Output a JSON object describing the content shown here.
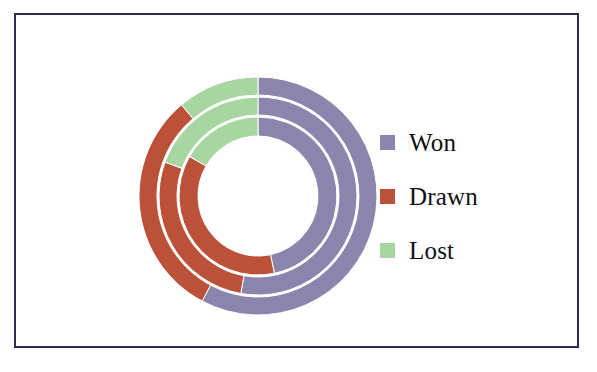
{
  "figure": {
    "background_color": "#ffffff",
    "frame_color": "#2b2b59",
    "title": ""
  },
  "legend": {
    "position": "right",
    "items": [
      {
        "label": "Won",
        "color": "#8b85ad",
        "swatch_name": "legend-swatch-won"
      },
      {
        "label": "Drawn",
        "color": "#bb5138",
        "swatch_name": "legend-swatch-drawn"
      },
      {
        "label": "Lost",
        "color": "#a7d6a1",
        "swatch_name": "legend-swatch-lost"
      }
    ]
  },
  "chart_data": {
    "type": "pie",
    "subtype": "nested-donut",
    "title": "",
    "xlabel": "",
    "ylabel": "",
    "grid": false,
    "legend_position": "right",
    "start_angle_deg": 0,
    "direction": "clockwise",
    "center": {
      "x": 242,
      "y": 181
    },
    "hole_radius": 60,
    "outer_radius": 119,
    "ring_gap": 2,
    "categories": [
      "Won",
      "Drawn",
      "Lost"
    ],
    "colors": [
      "#8b85ad",
      "#bb5138",
      "#a7d6a1"
    ],
    "rings": [
      {
        "name": "inner-ring",
        "r_inner": 60,
        "r_outer": 79,
        "values": [
          46.7,
          36.7,
          16.6
        ],
        "angles_deg": [
          168,
          132,
          60
        ],
        "slices": [
          {
            "label": "Won",
            "color": "#8b85ad",
            "start_deg": 0,
            "end_deg": 168,
            "value": 46.7
          },
          {
            "label": "Drawn",
            "color": "#bb5138",
            "start_deg": 168,
            "end_deg": 300,
            "value": 36.7
          },
          {
            "label": "Lost",
            "color": "#a7d6a1",
            "start_deg": 300,
            "end_deg": 360,
            "value": 16.6
          }
        ]
      },
      {
        "name": "middle-ring",
        "r_inner": 81,
        "r_outer": 99,
        "values": [
          52.8,
          27.8,
          19.4
        ],
        "angles_deg": [
          190,
          100,
          70
        ],
        "slices": [
          {
            "label": "Won",
            "color": "#8b85ad",
            "start_deg": 0,
            "end_deg": 190,
            "value": 52.8
          },
          {
            "label": "Drawn",
            "color": "#bb5138",
            "start_deg": 190,
            "end_deg": 290,
            "value": 27.8
          },
          {
            "label": "Lost",
            "color": "#a7d6a1",
            "start_deg": 290,
            "end_deg": 360,
            "value": 19.4
          }
        ]
      },
      {
        "name": "outer-ring",
        "r_inner": 101,
        "r_outer": 119,
        "values": [
          57.8,
          31.1,
          11.1
        ],
        "angles_deg": [
          208,
          112,
          40
        ],
        "slices": [
          {
            "label": "Won",
            "color": "#8b85ad",
            "start_deg": 0,
            "end_deg": 208,
            "value": 57.8
          },
          {
            "label": "Drawn",
            "color": "#bb5138",
            "start_deg": 208,
            "end_deg": 320,
            "value": 31.1
          },
          {
            "label": "Lost",
            "color": "#a7d6a1",
            "start_deg": 320,
            "end_deg": 360,
            "value": 11.1
          }
        ]
      }
    ]
  }
}
